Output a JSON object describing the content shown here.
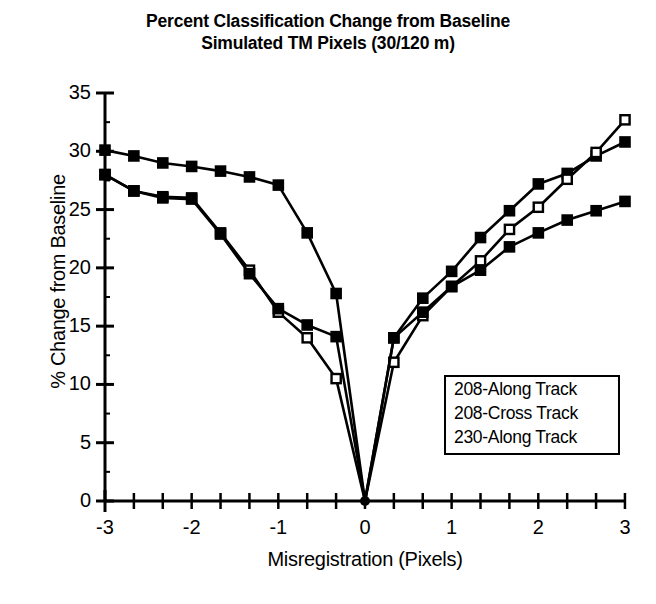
{
  "chart_data": {
    "type": "line",
    "title": "Percent Classification Change from Baseline",
    "subtitle": "Simulated TM Pixels (30/120 m)",
    "xlabel": "Misregistration (Pixels)",
    "ylabel": "% Change from Baseline",
    "xlim": [
      -3,
      3
    ],
    "ylim": [
      0,
      35
    ],
    "xticks": [
      -3,
      -2,
      -1,
      0,
      1,
      2,
      3
    ],
    "xtick_labels": [
      "-3",
      "-2",
      "-1",
      "0",
      "1",
      "2",
      "3"
    ],
    "xminor_step": 0.3333,
    "yticks": [
      0,
      5,
      10,
      15,
      20,
      25,
      30,
      35
    ],
    "ytick_labels": [
      "0",
      "5",
      "10",
      "15",
      "20",
      "25",
      "30",
      "35"
    ],
    "grid": false,
    "legend_position": "lower-right",
    "series": [
      {
        "name": "208-Along Track",
        "marker": "filled-square",
        "color": "#000000",
        "x": [
          -3,
          -2.667,
          -2.333,
          -2,
          -1.667,
          -1.333,
          -1,
          -0.667,
          -0.333,
          0,
          0.333,
          0.667,
          1,
          1.333,
          1.667,
          2,
          2.333,
          2.667,
          3
        ],
        "y": [
          30.1,
          29.6,
          29.0,
          28.7,
          28.3,
          27.8,
          27.1,
          23.0,
          17.8,
          0,
          14.0,
          17.4,
          19.7,
          22.6,
          24.9,
          27.2,
          28.1,
          29.6,
          30.8
        ]
      },
      {
        "name": "208-Cross Track",
        "marker": "open-square",
        "color": "#000000",
        "x": [
          -3,
          -2.667,
          -2.333,
          -2,
          -1.667,
          -1.333,
          -1,
          -0.667,
          -0.333,
          0,
          0.333,
          0.667,
          1,
          1.333,
          1.667,
          2,
          2.333,
          2.667,
          3
        ],
        "y": [
          28.0,
          26.6,
          26.1,
          26.0,
          23.0,
          19.8,
          16.2,
          14.0,
          10.5,
          0,
          11.9,
          15.9,
          18.4,
          20.6,
          23.3,
          25.2,
          27.6,
          29.9,
          32.7
        ]
      },
      {
        "name": "230-Along Track",
        "marker": "filled-square",
        "color": "#000000",
        "x": [
          -3,
          -2.667,
          -2.333,
          -2,
          -1.667,
          -1.333,
          -1,
          -0.667,
          -0.333,
          0,
          0.333,
          0.667,
          1,
          1.333,
          1.667,
          2,
          2.333,
          2.667,
          3
        ],
        "y": [
          28.0,
          26.6,
          26.0,
          25.9,
          22.9,
          19.5,
          16.5,
          15.1,
          14.1,
          0,
          14.0,
          16.2,
          18.4,
          19.8,
          21.8,
          23.0,
          24.1,
          24.9,
          25.7
        ]
      }
    ]
  },
  "legend": {
    "items": [
      "208-Along Track",
      "208-Cross Track",
      "230-Along Track"
    ]
  }
}
